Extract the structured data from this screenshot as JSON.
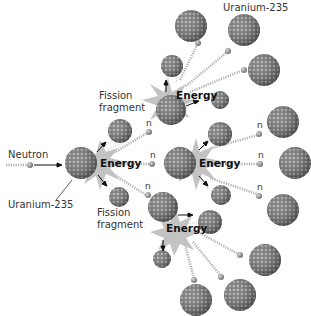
{
  "labels": {
    "neutron": "Neutron",
    "uranium_left": "Uranium-235",
    "uranium_top": "Uranium-235",
    "fission_fragment_top_line1": "Fission",
    "fission_fragment_top_line2": "fragment",
    "fission_fragment_bottom_line1": "Fission",
    "fission_fragment_bottom_line2": "fragment",
    "energy": "Energy",
    "neutron_short": "n"
  },
  "colors": {
    "nucleus": "#6e6e6e",
    "nucleus_highlight": "#a8a8a8",
    "flash": "#b8b8b8",
    "neutron": "#8a8a8a",
    "text": "#333333",
    "background": "#ffffff"
  }
}
